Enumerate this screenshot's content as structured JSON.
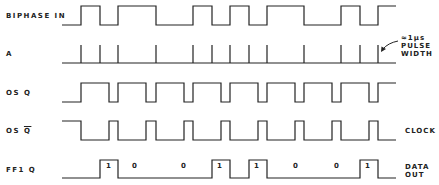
{
  "diagram": {
    "type": "timing-diagram",
    "stroke_color": "#222222",
    "x_start": 62,
    "x_end": 396,
    "signals": [
      {
        "label": "BIPHASE IN",
        "label_y": 12,
        "y_high": 6,
        "y_low": 25,
        "kind": "level",
        "initial": 0,
        "transitions": [
          81,
          100,
          118,
          156,
          193,
          212,
          230,
          249,
          267,
          304,
          341,
          360,
          378
        ]
      },
      {
        "label": "A",
        "label_y": 50,
        "y_high": 45,
        "y_low": 63,
        "kind": "pulses",
        "pulses": [
          81,
          100,
          118,
          156,
          193,
          212,
          230,
          249,
          267,
          304,
          341,
          360,
          378
        ]
      },
      {
        "label": "OS Q",
        "label_y": 89,
        "y_high": 83,
        "y_low": 102,
        "kind": "level",
        "initial": 0,
        "transitions": [
          81,
          109,
          118,
          146,
          156,
          184,
          193,
          221,
          230,
          258,
          267,
          295,
          304,
          332,
          341,
          369,
          378
        ]
      },
      {
        "label": "OS Q",
        "label_overbar": true,
        "label_y": 127,
        "y_high": 121,
        "y_low": 140,
        "kind": "level",
        "initial": 1,
        "transitions": [
          81,
          109,
          118,
          146,
          156,
          184,
          193,
          221,
          230,
          258,
          267,
          295,
          304,
          332,
          341,
          369,
          378
        ]
      },
      {
        "label": "FF1 Q",
        "label_y": 166,
        "y_high": 160,
        "y_low": 178,
        "kind": "level",
        "initial": 0,
        "transitions": [
          100,
          118,
          212,
          230,
          249,
          267,
          360,
          378
        ],
        "bits": [
          {
            "x": 108,
            "text": "1"
          },
          {
            "x": 134,
            "text": "0"
          },
          {
            "x": 183,
            "text": "0"
          },
          {
            "x": 219,
            "text": "1"
          },
          {
            "x": 256,
            "text": "1"
          },
          {
            "x": 295,
            "text": "0"
          },
          {
            "x": 336,
            "text": "0"
          },
          {
            "x": 367,
            "text": "1"
          }
        ]
      }
    ],
    "annotations": {
      "pulse_width_line1": "≈1µs",
      "pulse_width_line2": "PULSE",
      "pulse_width_line3": "WIDTH",
      "clock_label": "CLOCK",
      "data_out_line1": "DATA",
      "data_out_line2": "OUT"
    }
  }
}
